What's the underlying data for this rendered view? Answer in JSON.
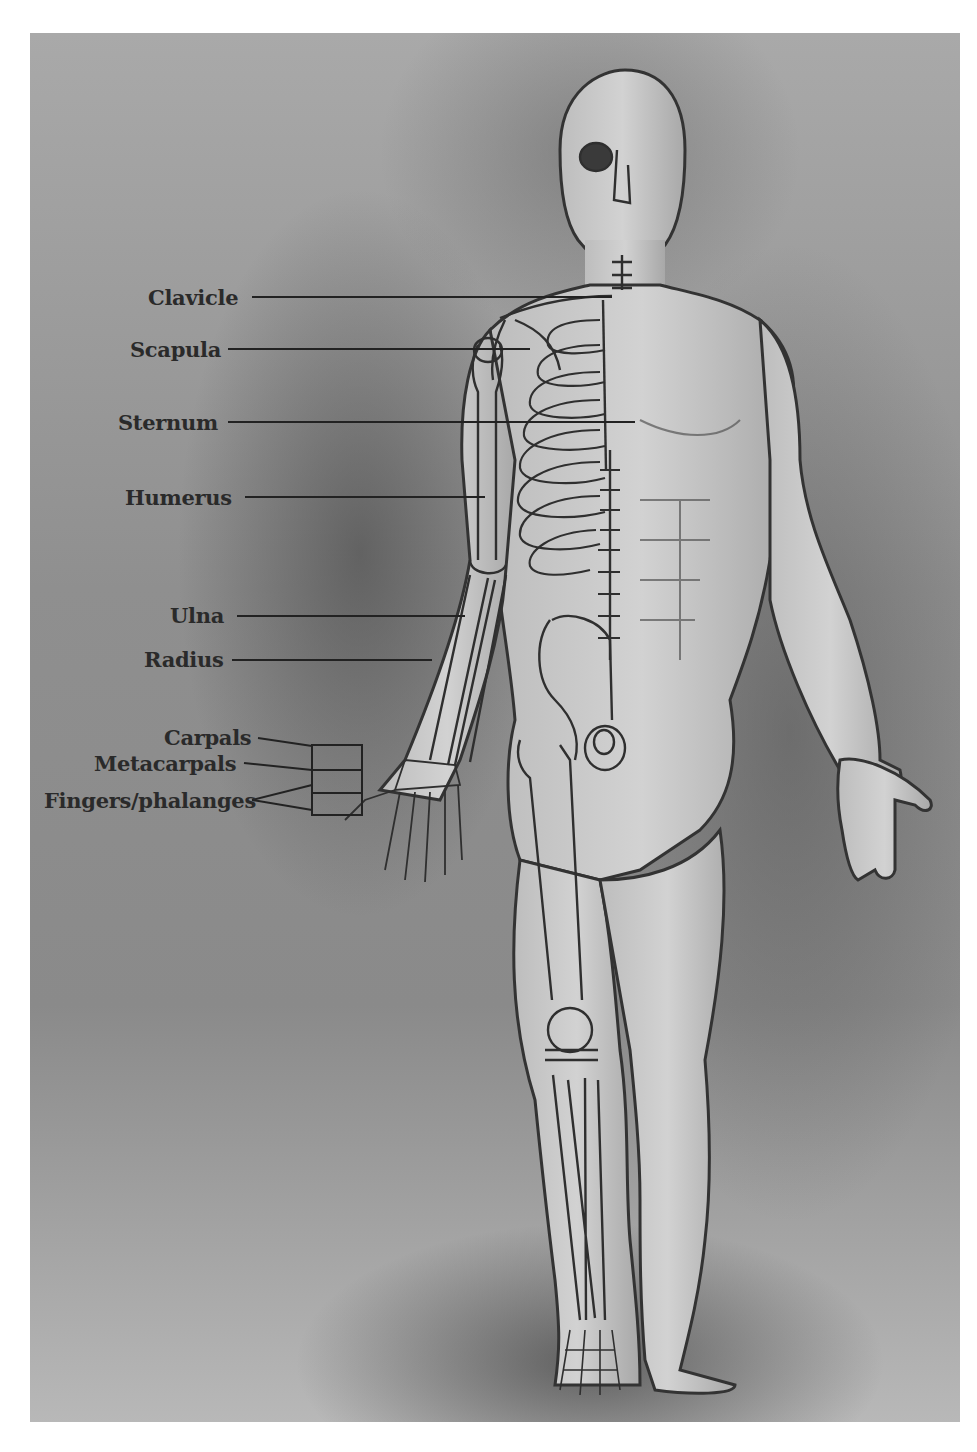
{
  "figure": {
    "colors": {
      "background": "#9a9a9a",
      "ink": "#2a2a2a",
      "skin": "#c9c9c9",
      "bone": "#d9d9d9",
      "page": "#ffffff"
    }
  },
  "labels": [
    {
      "id": "clavicle",
      "text": "Clavicle"
    },
    {
      "id": "scapula",
      "text": "Scapula"
    },
    {
      "id": "sternum",
      "text": "Sternum"
    },
    {
      "id": "humerus",
      "text": "Humerus"
    },
    {
      "id": "ulna",
      "text": "Ulna"
    },
    {
      "id": "radius",
      "text": "Radius"
    },
    {
      "id": "carpals",
      "text": "Carpals"
    },
    {
      "id": "metacarpals",
      "text": "Metacarpals"
    },
    {
      "id": "phalanges",
      "text": "Fingers/phalanges"
    }
  ]
}
